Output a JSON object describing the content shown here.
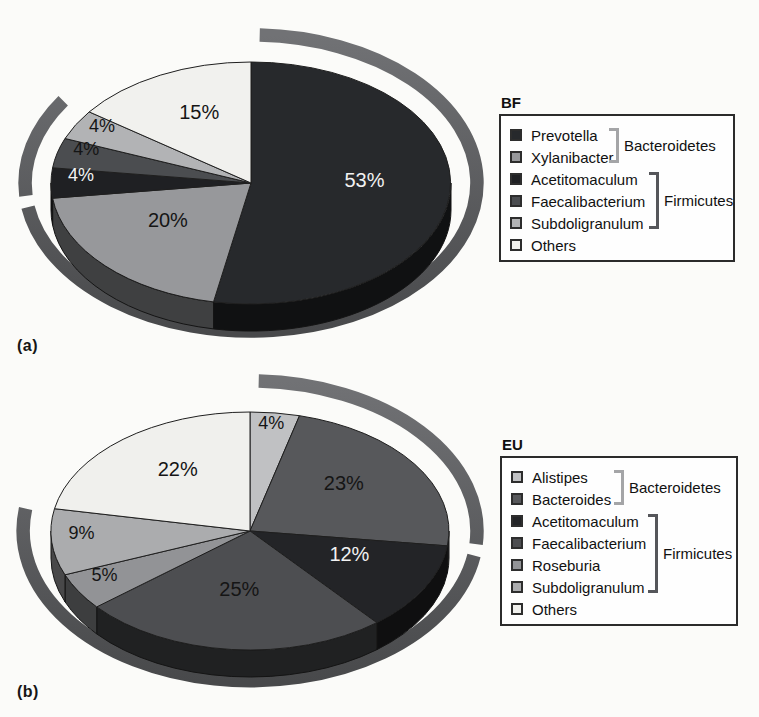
{
  "figure": {
    "background": "#fbfbf9"
  },
  "ring_color_top": "#717275",
  "ring_color_bottom": "#48494b",
  "chart_data": [
    {
      "type": "pie",
      "style": "3d pie with outer grouping ring arcs",
      "panel": "a",
      "panel_label": "(a)",
      "title": "BF",
      "unit": "%",
      "start_angle": "top",
      "direction": "clockwise",
      "labels": [
        "Prevotella",
        "Xylanibacter",
        "Acetitomaculum",
        "Faecalibacterium",
        "Subdoligranulum",
        "Others"
      ],
      "values": [
        53,
        20,
        4,
        4,
        4,
        15
      ],
      "colors": [
        "#27292c",
        "#97989b",
        "#1f2023",
        "#4b4d50",
        "#b2b3b5",
        "#f1f1ee"
      ],
      "groups": [
        {
          "name": "Bacteroidetes",
          "members": [
            "Prevotella",
            "Xylanibacter"
          ],
          "bracket_color": "#a4a5a7",
          "arc_from_pct": 0,
          "arc_to_pct": 73
        },
        {
          "name": "Firmicutes",
          "members": [
            "Acetitomaculum",
            "Faecalibacterium",
            "Subdoligranulum"
          ],
          "bracket_color": "#55565a",
          "arc_from_pct": 73,
          "arc_to_pct": 85
        }
      ]
    },
    {
      "type": "pie",
      "style": "3d pie with outer grouping ring arcs",
      "panel": "b",
      "panel_label": "(b)",
      "title": "EU",
      "unit": "%",
      "start_angle": "top",
      "direction": "clockwise",
      "labels": [
        "Alistipes",
        "Bacteroides",
        "Acetitomaculum",
        "Faecalibacterium",
        "Roseburia",
        "Subdoligranulum",
        "Others"
      ],
      "values": [
        4,
        23,
        12,
        25,
        5,
        9,
        22
      ],
      "colors": [
        "#c0c1c3",
        "#57585b",
        "#232427",
        "#4d4e51",
        "#929396",
        "#abacae",
        "#f0f0ed"
      ],
      "groups": [
        {
          "name": "Bacteroidetes",
          "members": [
            "Alistipes",
            "Bacteroides"
          ],
          "bracket_color": "#a4a5a7",
          "arc_from_pct": 0,
          "arc_to_pct": 27
        },
        {
          "name": "Firmicutes",
          "members": [
            "Acetitomaculum",
            "Faecalibacterium",
            "Roseburia",
            "Subdoligranulum"
          ],
          "bracket_color": "#55565a",
          "arc_from_pct": 27,
          "arc_to_pct": 78
        }
      ]
    }
  ]
}
